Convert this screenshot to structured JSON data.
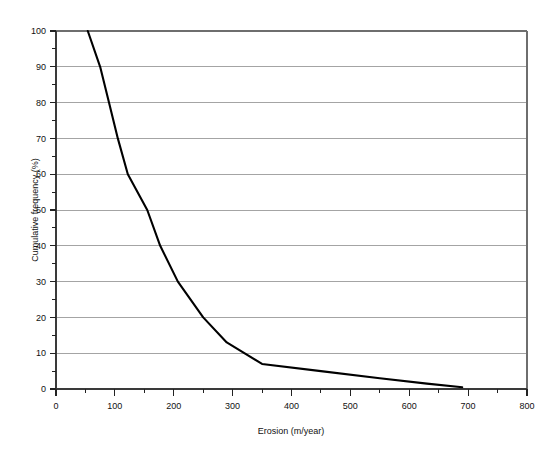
{
  "chart_data": {
    "type": "line",
    "title": "",
    "xlabel": "Erosion (m/year)",
    "ylabel": "Cumulative frequency (%)",
    "xlim": [
      0,
      800
    ],
    "ylim": [
      0,
      100
    ],
    "grid": "horizontal",
    "legend": "none",
    "x_major_ticks": [
      0,
      100,
      200,
      300,
      400,
      500,
      600,
      700,
      800
    ],
    "x_major_tick_labels": [
      "0",
      "100",
      "200",
      "300",
      "400",
      "500",
      "600",
      "700",
      "800"
    ],
    "x_minor_ticks": [
      50,
      150,
      250,
      350,
      450,
      550,
      650,
      750
    ],
    "y_major_ticks": [
      0,
      10,
      20,
      30,
      40,
      50,
      60,
      70,
      80,
      90,
      100
    ],
    "y_major_tick_labels": [
      "0",
      "10",
      "20",
      "30",
      "40",
      "50",
      "60",
      "70",
      "80",
      "90",
      "100"
    ],
    "y_minor_ticks": [
      5,
      15,
      25,
      35,
      45,
      55,
      65,
      75,
      85,
      95
    ],
    "series": [
      {
        "name": "Cumulative frequency",
        "color": "#000000",
        "points": [
          [
            54,
            100
          ],
          [
            75,
            90
          ],
          [
            90,
            80
          ],
          [
            105,
            70
          ],
          [
            122,
            60
          ],
          [
            155,
            50
          ],
          [
            177,
            40
          ],
          [
            207,
            30
          ],
          [
            250,
            20
          ],
          [
            290,
            13
          ],
          [
            350,
            7
          ],
          [
            450,
            5
          ],
          [
            550,
            3
          ],
          [
            630,
            1.5
          ],
          [
            690,
            0.5
          ]
        ]
      }
    ]
  }
}
